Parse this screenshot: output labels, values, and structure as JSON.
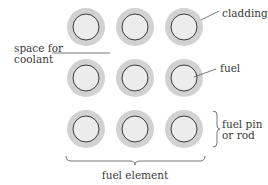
{
  "diagram": {
    "rows": 3,
    "cols": 3,
    "labels": {
      "cladding": "cladding",
      "fuel": "fuel",
      "coolant_line1": "space for",
      "coolant_line2": "coolant",
      "pin_line1": "fuel pin",
      "pin_line2": "or rod",
      "element": "fuel element"
    },
    "colors": {
      "cladding": "#d2d2d2",
      "fuel": "#ececec",
      "outline": "#3c3c3c",
      "leader": "#555555"
    }
  }
}
